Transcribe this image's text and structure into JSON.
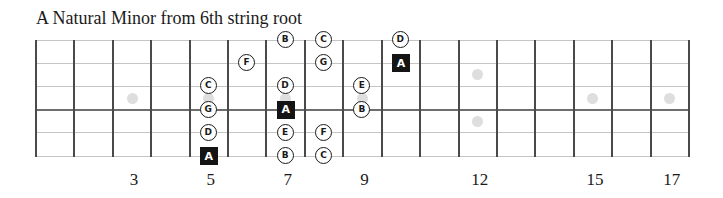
{
  "title": "A Natural Minor from 6th string root",
  "fretboard": {
    "fret_count": 17,
    "string_count": 6,
    "left_x": 36,
    "fret_spacing": 38.41,
    "string_top_y": 40,
    "string_spacing": 23.2,
    "colors": {
      "fret_line": "#4a4a4a",
      "string_line": "#c4c4c4",
      "inlay": "#dedede",
      "note_border": "#1a1a1a",
      "root_fill": "#141414"
    },
    "inlays": [
      {
        "fret": 3,
        "position": "center"
      },
      {
        "fret": 5,
        "position": "center"
      },
      {
        "fret": 7,
        "position": "center"
      },
      {
        "fret": 9,
        "position": "center"
      },
      {
        "fret": 12,
        "position": "upper"
      },
      {
        "fret": 12,
        "position": "lower"
      },
      {
        "fret": 15,
        "position": "center"
      },
      {
        "fret": 17,
        "position": "center"
      }
    ],
    "fret_numbers": [
      {
        "fret": 3,
        "label": "3"
      },
      {
        "fret": 5,
        "label": "5"
      },
      {
        "fret": 7,
        "label": "7"
      },
      {
        "fret": 9,
        "label": "9"
      },
      {
        "fret": 12,
        "label": "12"
      },
      {
        "fret": 15,
        "label": "15"
      },
      {
        "fret": 17,
        "label": "17"
      }
    ],
    "notes": [
      {
        "string": 3,
        "fret": 5,
        "label": "C",
        "root": false
      },
      {
        "string": 4,
        "fret": 5,
        "label": "G",
        "root": false
      },
      {
        "string": 5,
        "fret": 5,
        "label": "D",
        "root": false
      },
      {
        "string": 6,
        "fret": 5,
        "label": "A",
        "root": true
      },
      {
        "string": 2,
        "fret": 6,
        "label": "F",
        "root": false
      },
      {
        "string": 1,
        "fret": 7,
        "label": "B",
        "root": false
      },
      {
        "string": 3,
        "fret": 7,
        "label": "D",
        "root": false
      },
      {
        "string": 4,
        "fret": 7,
        "label": "A",
        "root": true
      },
      {
        "string": 5,
        "fret": 7,
        "label": "E",
        "root": false
      },
      {
        "string": 6,
        "fret": 7,
        "label": "B",
        "root": false
      },
      {
        "string": 1,
        "fret": 8,
        "label": "C",
        "root": false
      },
      {
        "string": 2,
        "fret": 8,
        "label": "G",
        "root": false
      },
      {
        "string": 5,
        "fret": 8,
        "label": "F",
        "root": false
      },
      {
        "string": 6,
        "fret": 8,
        "label": "C",
        "root": false
      },
      {
        "string": 3,
        "fret": 9,
        "label": "E",
        "root": false
      },
      {
        "string": 4,
        "fret": 9,
        "label": "B",
        "root": false
      },
      {
        "string": 1,
        "fret": 10,
        "label": "D",
        "root": false
      },
      {
        "string": 2,
        "fret": 10,
        "label": "A",
        "root": true
      }
    ]
  }
}
